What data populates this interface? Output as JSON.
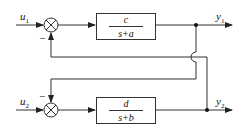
{
  "diagram": {
    "inputs": {
      "u1": {
        "symbol": "u",
        "index": "1"
      },
      "u2": {
        "symbol": "u",
        "index": "2"
      }
    },
    "outputs": {
      "y1": {
        "symbol": "y",
        "index": "1"
      },
      "y2": {
        "symbol": "y",
        "index": "2"
      }
    },
    "summers": {
      "upper": {
        "feedback_sign": "−"
      },
      "lower": {
        "feedback_sign": "−"
      }
    },
    "blocks": {
      "upper": {
        "numerator": "c",
        "denominator": "s+a"
      },
      "lower": {
        "numerator": "d",
        "denominator": "s+b"
      }
    },
    "feedback": [
      {
        "from": "y2",
        "to": "upper-summer",
        "sign": "−"
      },
      {
        "from": "y1",
        "to": "lower-summer",
        "sign": "−"
      }
    ],
    "colors": {
      "line": "#333333",
      "background": "#ffffff"
    }
  }
}
